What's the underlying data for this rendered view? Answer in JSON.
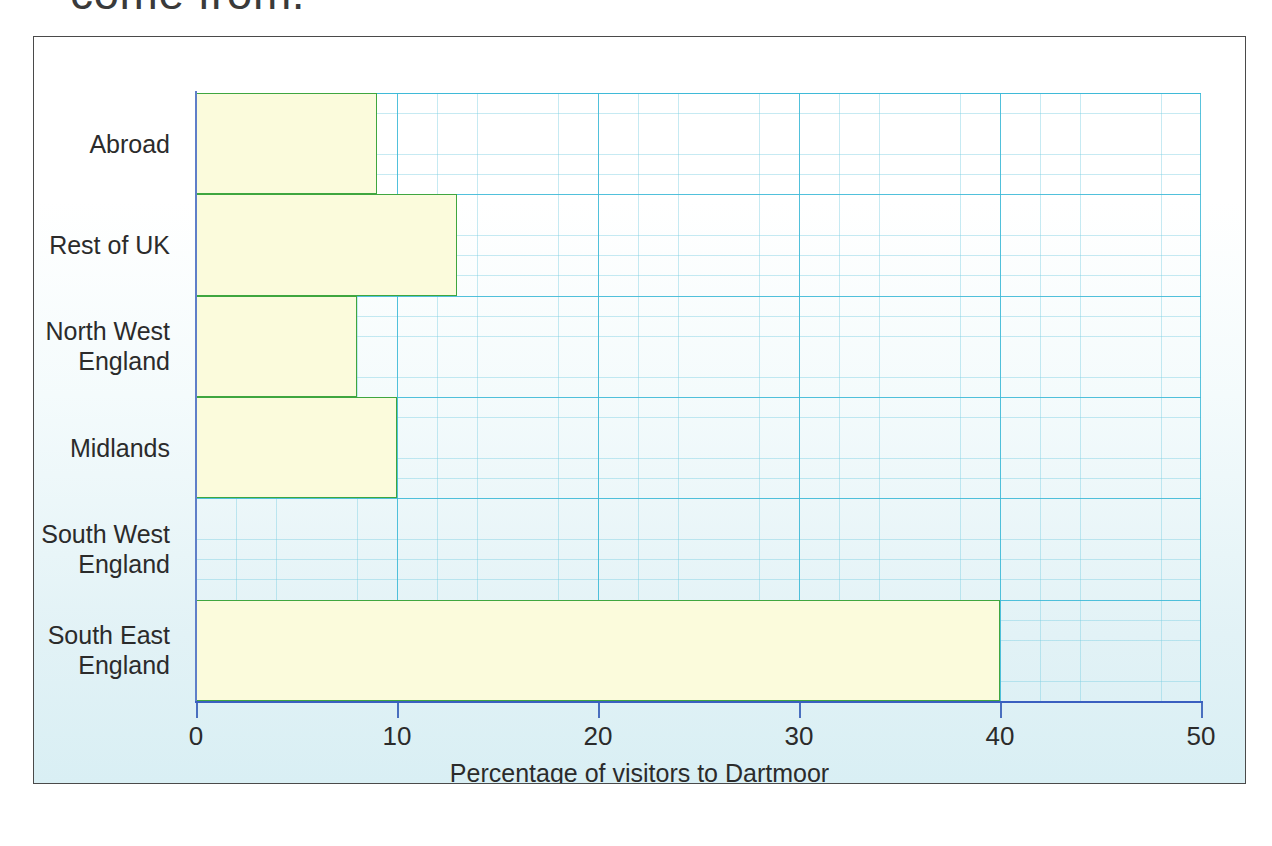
{
  "caption": {
    "partial_text": "come from."
  },
  "chart_data": {
    "type": "bar",
    "orientation": "horizontal",
    "title": "",
    "xlabel": "Percentage of visitors to Dartmoor",
    "ylabel": "",
    "categories": [
      "Abroad",
      "Rest of UK",
      "North West England",
      "Midlands",
      "South West England",
      "South East England"
    ],
    "category_lines": [
      [
        "Abroad"
      ],
      [
        "Rest of UK"
      ],
      [
        "North West",
        "England"
      ],
      [
        "Midlands"
      ],
      [
        "South West",
        "England"
      ],
      [
        "South East",
        "England"
      ]
    ],
    "values": [
      9,
      13,
      8,
      10,
      0,
      40
    ],
    "xlim": [
      0,
      50
    ],
    "xticks": [
      0,
      10,
      20,
      30,
      40,
      50
    ],
    "xtick_labels": [
      "0",
      "10",
      "20",
      "30",
      "40",
      "50"
    ],
    "grid": true,
    "grid_major_step": 10,
    "grid_minor_step": 2,
    "legend": "none",
    "bar_fill_color": "#fbfbdc",
    "bar_edge_color": "#3fa63f",
    "axis_color": "#3a5fc0",
    "grid_color": "#3cb9d7",
    "background_color": "#e2f2f6"
  }
}
